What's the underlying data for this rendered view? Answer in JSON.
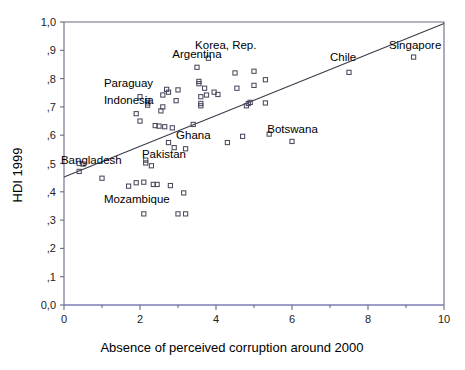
{
  "chart_data": {
    "type": "scatter",
    "title": "",
    "xlabel": "Absence of perceived corruption around 2000",
    "ylabel": "HDI 1999",
    "xlim": [
      0,
      10
    ],
    "ylim": [
      0.0,
      1.0
    ],
    "grid": false,
    "legend": "none",
    "x_ticks": [
      {
        "value": 0,
        "label": "0"
      },
      {
        "value": 2,
        "label": "2"
      },
      {
        "value": 4,
        "label": "4"
      },
      {
        "value": 6,
        "label": "6"
      },
      {
        "value": 8,
        "label": "8"
      },
      {
        "value": 10,
        "label": "10"
      }
    ],
    "x_minor_ticks": [
      1,
      3,
      5,
      7,
      9
    ],
    "y_ticks": [
      {
        "value": 0.0,
        "label": "0,0"
      },
      {
        "value": 0.1,
        "label": ",1"
      },
      {
        "value": 0.2,
        "label": ",2"
      },
      {
        "value": 0.3,
        "label": ",3"
      },
      {
        "value": 0.4,
        "label": ",4"
      },
      {
        "value": 0.5,
        "label": ",5"
      },
      {
        "value": 0.6,
        "label": ",6"
      },
      {
        "value": 0.7,
        "label": ",7"
      },
      {
        "value": 0.8,
        "label": ",8"
      },
      {
        "value": 0.9,
        "label": ",9"
      },
      {
        "value": 1.0,
        "label": "1,0"
      }
    ],
    "fit_line": {
      "x0": 0,
      "y0": 0.452,
      "x1": 10,
      "y1": 0.995
    },
    "points": [
      {
        "x": 0.4,
        "y": 0.472
      },
      {
        "x": 0.4,
        "y": 0.5
      },
      {
        "x": 0.5,
        "y": 0.498
      },
      {
        "x": 1.0,
        "y": 0.448
      },
      {
        "x": 1.7,
        "y": 0.42
      },
      {
        "x": 1.9,
        "y": 0.432
      },
      {
        "x": 1.9,
        "y": 0.676
      },
      {
        "x": 2.0,
        "y": 0.65
      },
      {
        "x": 2.0,
        "y": 0.736
      },
      {
        "x": 2.1,
        "y": 0.434
      },
      {
        "x": 2.1,
        "y": 0.322
      },
      {
        "x": 2.15,
        "y": 0.502
      },
      {
        "x": 2.15,
        "y": 0.512
      },
      {
        "x": 2.2,
        "y": 0.722
      },
      {
        "x": 2.2,
        "y": 0.714
      },
      {
        "x": 2.2,
        "y": 0.706
      },
      {
        "x": 2.3,
        "y": 0.492
      },
      {
        "x": 2.35,
        "y": 0.426
      },
      {
        "x": 2.45,
        "y": 0.426
      },
      {
        "x": 2.4,
        "y": 0.634
      },
      {
        "x": 2.5,
        "y": 0.632
      },
      {
        "x": 2.55,
        "y": 0.686
      },
      {
        "x": 2.6,
        "y": 0.7
      },
      {
        "x": 2.6,
        "y": 0.742
      },
      {
        "x": 2.65,
        "y": 0.63
      },
      {
        "x": 2.7,
        "y": 0.762
      },
      {
        "x": 2.75,
        "y": 0.752
      },
      {
        "x": 2.75,
        "y": 0.574
      },
      {
        "x": 2.8,
        "y": 0.422
      },
      {
        "x": 2.85,
        "y": 0.626
      },
      {
        "x": 2.9,
        "y": 0.556
      },
      {
        "x": 2.95,
        "y": 0.722
      },
      {
        "x": 3.0,
        "y": 0.76
      },
      {
        "x": 3.0,
        "y": 0.322
      },
      {
        "x": 3.15,
        "y": 0.396
      },
      {
        "x": 3.2,
        "y": 0.322
      },
      {
        "x": 3.2,
        "y": 0.552
      },
      {
        "x": 3.4,
        "y": 0.638
      },
      {
        "x": 3.5,
        "y": 0.84
      },
      {
        "x": 3.55,
        "y": 0.79
      },
      {
        "x": 3.55,
        "y": 0.782
      },
      {
        "x": 3.6,
        "y": 0.736
      },
      {
        "x": 3.6,
        "y": 0.704
      },
      {
        "x": 3.6,
        "y": 0.712
      },
      {
        "x": 3.7,
        "y": 0.766
      },
      {
        "x": 3.75,
        "y": 0.742
      },
      {
        "x": 3.8,
        "y": 0.872
      },
      {
        "x": 3.95,
        "y": 0.752
      },
      {
        "x": 4.05,
        "y": 0.744
      },
      {
        "x": 4.3,
        "y": 0.574
      },
      {
        "x": 4.5,
        "y": 0.82
      },
      {
        "x": 4.55,
        "y": 0.766
      },
      {
        "x": 4.7,
        "y": 0.596
      },
      {
        "x": 4.8,
        "y": 0.704
      },
      {
        "x": 4.85,
        "y": 0.712
      },
      {
        "x": 4.9,
        "y": 0.716
      },
      {
        "x": 5.0,
        "y": 0.826
      },
      {
        "x": 5.0,
        "y": 0.776
      },
      {
        "x": 5.3,
        "y": 0.796
      },
      {
        "x": 5.3,
        "y": 0.714
      },
      {
        "x": 5.4,
        "y": 0.604
      },
      {
        "x": 6.0,
        "y": 0.578
      },
      {
        "x": 7.5,
        "y": 0.822
      },
      {
        "x": 9.2,
        "y": 0.876
      }
    ],
    "annotations": [
      {
        "text": "Korea, Rep.",
        "x": 3.45,
        "y": 0.905,
        "anchor": "start"
      },
      {
        "text": "Argentina",
        "x": 2.85,
        "y": 0.872,
        "anchor": "start"
      },
      {
        "text": "Singapore",
        "x": 8.55,
        "y": 0.905,
        "anchor": "start"
      },
      {
        "text": "Chile",
        "x": 7.0,
        "y": 0.862,
        "anchor": "start"
      },
      {
        "text": "Paraguay",
        "x": 1.05,
        "y": 0.772,
        "anchor": "start"
      },
      {
        "text": "Indonesia",
        "x": 1.05,
        "y": 0.712,
        "anchor": "start"
      },
      {
        "text": "Botswana",
        "x": 5.35,
        "y": 0.608,
        "anchor": "start"
      },
      {
        "text": "Ghana",
        "x": 2.95,
        "y": 0.588,
        "anchor": "start"
      },
      {
        "text": "Pakistan",
        "x": 2.05,
        "y": 0.518,
        "anchor": "start"
      },
      {
        "text": "Bangladesh",
        "x": -0.08,
        "y": 0.5,
        "anchor": "start"
      },
      {
        "text": "Mozambique",
        "x": 1.05,
        "y": 0.362,
        "anchor": "start"
      }
    ]
  }
}
